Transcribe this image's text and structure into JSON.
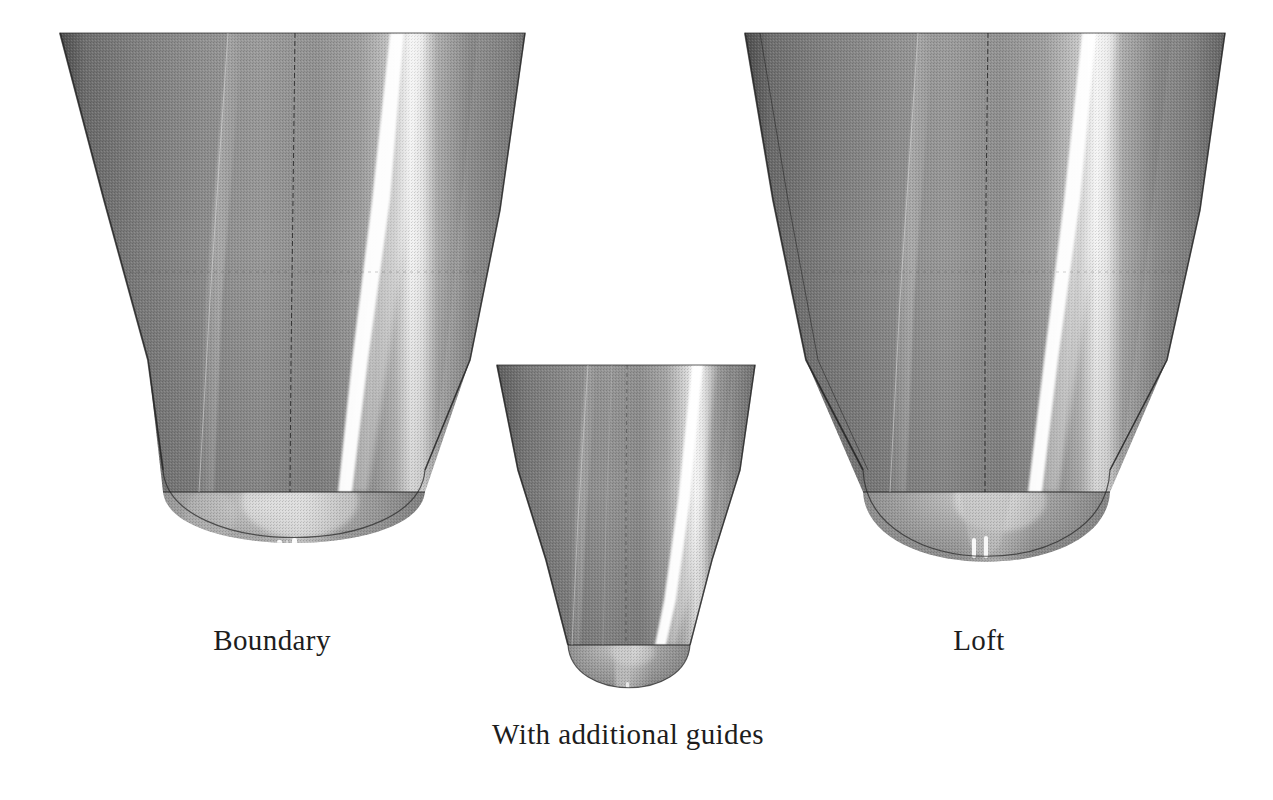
{
  "figure": {
    "background_color": "#ffffff",
    "render_style": "grayscale-shaded-cad-surface",
    "ink_color": "#1d1d1d",
    "surface_colors": {
      "dark_edge": "#3c3c3c",
      "mid_gray": "#8a8a8a",
      "light_gray": "#b4b4b4",
      "specular_highlight": "#ffffff",
      "shadow": "#4a4a4a",
      "isoline": "#2b2b2b"
    },
    "panels": [
      {
        "id": "boundary",
        "label": "Boundary",
        "label_x": 272,
        "label_y": 624,
        "top_left_x": 60,
        "top_right_x": 525,
        "top_y": 33,
        "waist_left_x": 196,
        "waist_right_x": 392,
        "seam_y": 492,
        "tip_x": 294,
        "tip_y": 578,
        "nose_profile": "hemispherical-dome",
        "highlight_top_x": 392,
        "highlight_bottom_x": 330,
        "centerline_top_x": 295,
        "centerline_bottom_x": 292
      },
      {
        "id": "guides",
        "label": "With additional guides",
        "label_x": 628,
        "label_y": 718,
        "top_left_x": 497,
        "top_right_x": 755,
        "top_y": 365,
        "waist_left_x": 586,
        "waist_right_x": 672,
        "seam_y": 645,
        "tip_x": 629,
        "tip_y": 703,
        "nose_profile": "narrow-parabolic",
        "highlight_top_x": 690,
        "highlight_bottom_x": 648,
        "centerline_top_x": 627,
        "centerline_bottom_x": 626
      },
      {
        "id": "loft",
        "label": "Loft",
        "label_x": 979,
        "label_y": 624,
        "top_left_x": 745,
        "top_right_x": 1225,
        "top_y": 33,
        "waist_left_x": 891,
        "waist_right_x": 1082,
        "seam_y": 492,
        "tip_x": 986,
        "tip_y": 588,
        "nose_profile": "pointed-parabolic",
        "highlight_top_x": 1086,
        "highlight_bottom_x": 1020,
        "centerline_top_x": 988,
        "centerline_bottom_x": 985
      }
    ],
    "specular_dots": [
      {
        "panel": "boundary",
        "x": 277,
        "y": 542,
        "w": 5,
        "h": 20
      },
      {
        "panel": "boundary",
        "x": 292,
        "y": 540,
        "w": 5,
        "h": 22
      },
      {
        "panel": "loft",
        "x": 972,
        "y": 540,
        "w": 4,
        "h": 18
      },
      {
        "panel": "loft",
        "x": 984,
        "y": 538,
        "w": 4,
        "h": 20
      }
    ]
  }
}
